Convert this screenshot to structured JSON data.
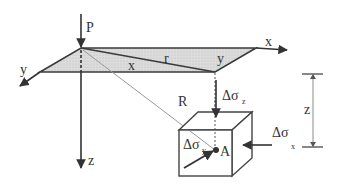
{
  "figure": {
    "labels": {
      "P": "P",
      "x_axis": "x",
      "y_axis": "y",
      "z_axis": "z",
      "r": "r",
      "x_in_plane": "x",
      "y_in_plane": "y",
      "R": "R",
      "A": "A",
      "depth_z": "z",
      "sigma_z_main": "Δσ",
      "sigma_z_sub": "z",
      "sigma_x_main": "Δσ",
      "sigma_x_sub": "x",
      "sigma_y_main": "Δσ",
      "sigma_y_sub": "y"
    },
    "colors": {
      "stroke": "#333333",
      "plane_fill": "#d9d9d9",
      "thin_line": "#9a9a9a"
    }
  }
}
